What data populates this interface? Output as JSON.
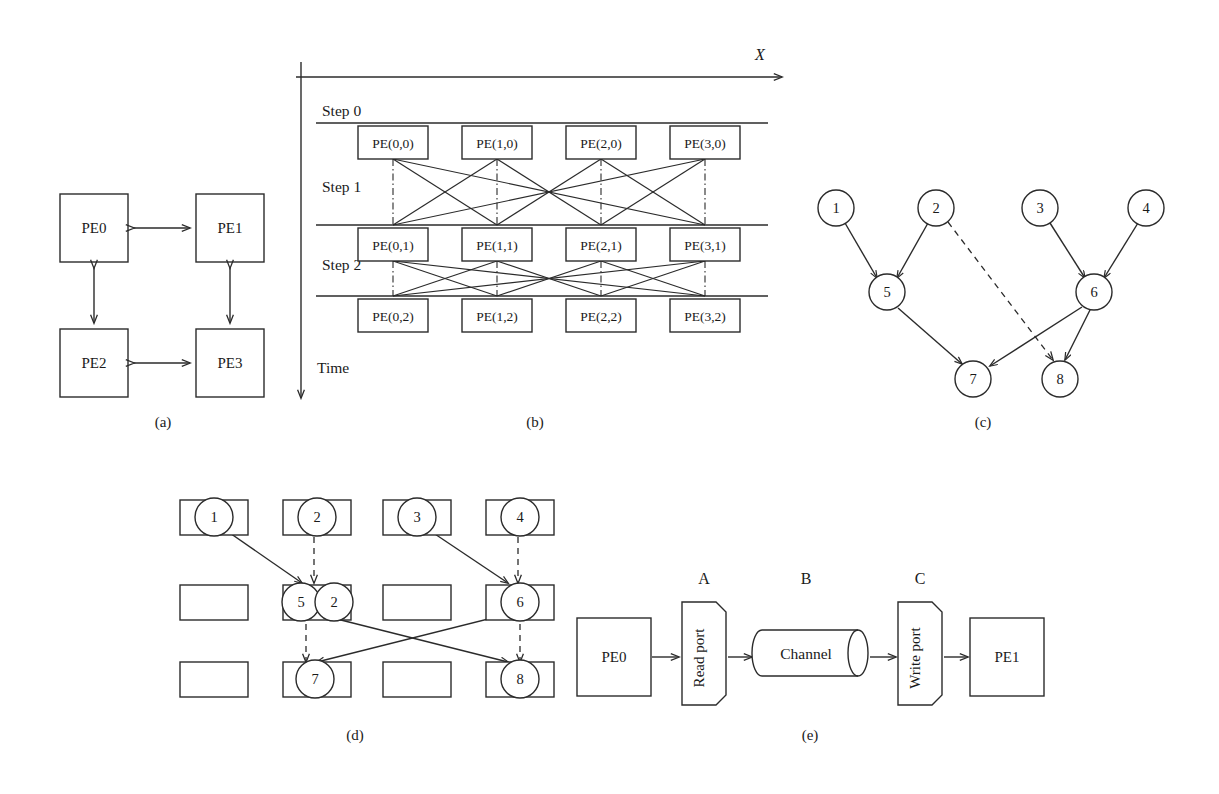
{
  "figure": {
    "background": "#ffffff",
    "ink_color": "#2b2b2b"
  },
  "panel_labels": {
    "a": "(a)",
    "b": "(b)",
    "c": "(c)",
    "d": "(d)",
    "e": "(e)"
  },
  "panel_a": {
    "caption": "(a)",
    "nodes": [
      {
        "id": "pe0",
        "label": "PE0"
      },
      {
        "id": "pe1",
        "label": "PE1"
      },
      {
        "id": "pe2",
        "label": "PE2"
      },
      {
        "id": "pe3",
        "label": "PE3"
      }
    ],
    "links": [
      {
        "from": "PE0",
        "to": "PE1",
        "style": "double-arrow"
      },
      {
        "from": "PE0",
        "to": "PE2",
        "style": "double-arrow"
      },
      {
        "from": "PE1",
        "to": "PE3",
        "style": "double-arrow"
      },
      {
        "from": "PE2",
        "to": "PE3",
        "style": "double-arrow"
      }
    ]
  },
  "panel_b": {
    "caption": "(b)",
    "axis_x_label": "X",
    "axis_time_label": "Time",
    "steps": [
      {
        "label": "Step 0"
      },
      {
        "label": "Step 1"
      },
      {
        "label": "Step 2"
      }
    ],
    "rows": [
      {
        "step": "Step 0",
        "cells": [
          "PE(0,0)",
          "PE(1,0)",
          "PE(2,0)",
          "PE(3,0)"
        ]
      },
      {
        "step": "Step 1",
        "cells": [
          "PE(0,1)",
          "PE(1,1)",
          "PE(2,1)",
          "PE(3,1)"
        ]
      },
      {
        "step": "Step 2",
        "cells": [
          "PE(0,2)",
          "PE(1,2)",
          "PE(2,2)",
          "PE(3,2)"
        ]
      }
    ]
  },
  "panel_c": {
    "caption": "(c)",
    "nodes": [
      {
        "id": "1",
        "label": "1"
      },
      {
        "id": "2",
        "label": "2"
      },
      {
        "id": "3",
        "label": "3"
      },
      {
        "id": "4",
        "label": "4"
      },
      {
        "id": "5",
        "label": "5"
      },
      {
        "id": "6",
        "label": "6"
      },
      {
        "id": "7",
        "label": "7"
      },
      {
        "id": "8",
        "label": "8"
      }
    ],
    "edges": [
      {
        "from": "1",
        "to": "5",
        "style": "solid"
      },
      {
        "from": "2",
        "to": "5",
        "style": "solid"
      },
      {
        "from": "2",
        "to": "8",
        "style": "dashed"
      },
      {
        "from": "3",
        "to": "6",
        "style": "solid"
      },
      {
        "from": "4",
        "to": "6",
        "style": "solid"
      },
      {
        "from": "5",
        "to": "7",
        "style": "solid"
      },
      {
        "from": "6",
        "to": "7",
        "style": "solid"
      },
      {
        "from": "6",
        "to": "8",
        "style": "solid"
      }
    ]
  },
  "panel_d": {
    "caption": "(d)",
    "grid": {
      "rows": 3,
      "columns": 4,
      "cells": [
        [
          {
            "nodes": [
              "1"
            ]
          },
          {
            "nodes": [
              "2"
            ]
          },
          {
            "nodes": [
              "3"
            ]
          },
          {
            "nodes": [
              "4"
            ]
          }
        ],
        [
          {
            "nodes": []
          },
          {
            "nodes": [
              "5",
              "2"
            ]
          },
          {
            "nodes": []
          },
          {
            "nodes": [
              "6"
            ]
          }
        ],
        [
          {
            "nodes": []
          },
          {
            "nodes": [
              "7"
            ]
          },
          {
            "nodes": []
          },
          {
            "nodes": [
              "8"
            ]
          }
        ]
      ]
    },
    "edges": [
      {
        "from": "1",
        "to": "5",
        "style": "solid"
      },
      {
        "from": "2",
        "to": "2",
        "style": "dashed"
      },
      {
        "from": "3",
        "to": "6",
        "style": "solid"
      },
      {
        "from": "4",
        "to": "6",
        "style": "dashed"
      },
      {
        "from": "5",
        "to": "7",
        "style": "dashed"
      },
      {
        "from": "5",
        "to": "8",
        "style": "solid"
      },
      {
        "from": "6",
        "to": "7",
        "style": "solid"
      },
      {
        "from": "6",
        "to": "8",
        "style": "dashed"
      }
    ]
  },
  "panel_e": {
    "caption": "(e)",
    "markers": [
      {
        "id": "A",
        "label": "A"
      },
      {
        "id": "B",
        "label": "B"
      },
      {
        "id": "C",
        "label": "C"
      }
    ],
    "blocks": [
      {
        "id": "pe0",
        "label": "PE0",
        "shape": "rect"
      },
      {
        "id": "read-port",
        "label": "Read port",
        "shape": "port"
      },
      {
        "id": "channel",
        "label": "Channel",
        "shape": "cylinder"
      },
      {
        "id": "write-port",
        "label": "Write port",
        "shape": "port"
      },
      {
        "id": "pe1",
        "label": "PE1",
        "shape": "rect"
      }
    ],
    "flow": [
      "PE0",
      "Read port",
      "Channel",
      "Write port",
      "PE1"
    ]
  }
}
